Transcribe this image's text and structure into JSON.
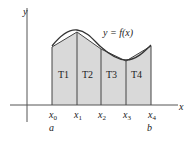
{
  "diagram": {
    "axis_x_label": "x",
    "axis_y_label": "y",
    "curve_label": "y = f(x)",
    "points": [
      {
        "label": "x",
        "sub": "0",
        "below": "a"
      },
      {
        "label": "x",
        "sub": "1",
        "below": ""
      },
      {
        "label": "x",
        "sub": "2",
        "below": ""
      },
      {
        "label": "x",
        "sub": "3",
        "below": ""
      },
      {
        "label": "x",
        "sub": "4",
        "below": "b"
      }
    ],
    "trapezoids": [
      "T1",
      "T2",
      "T3",
      "T4"
    ],
    "colors": {
      "fill": "#d9d9d9",
      "line": "#333333"
    }
  }
}
